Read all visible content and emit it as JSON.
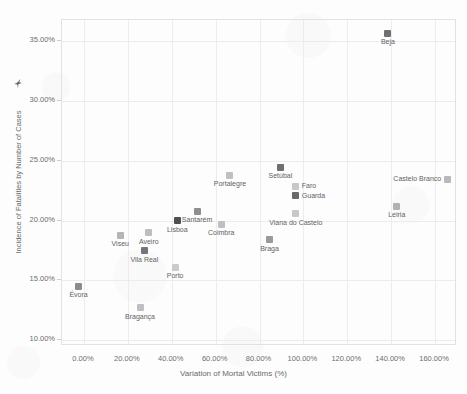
{
  "chart_data": {
    "type": "scatter",
    "title": "",
    "xlabel": "Variation of Mortal Victims (%)",
    "ylabel": "Incidence of Fatalities by Number of Cases",
    "xlim": [
      -10,
      170
    ],
    "ylim": [
      9.5,
      36.8
    ],
    "grid": true,
    "legend": "none",
    "xticks": [
      "0.00%",
      "20.00%",
      "40.00%",
      "60.00%",
      "80.00%",
      "100.00%",
      "120.00%",
      "140.00%",
      "160.00%"
    ],
    "xtick_values": [
      0,
      20,
      40,
      60,
      80,
      100,
      120,
      140,
      160
    ],
    "yticks": [
      "10.00%",
      "15.00%",
      "20.00%",
      "25.00%",
      "30.00%",
      "35.00%"
    ],
    "ytick_values": [
      10,
      15,
      20,
      25,
      30,
      35
    ],
    "marker": "square",
    "points": [
      {
        "label": "Beja",
        "x": 139.0,
        "y": 35.6,
        "color": "#6f6f6f",
        "label_pos": "below"
      },
      {
        "label": "Castelo Branco",
        "x": 166.0,
        "y": 23.4,
        "color": "#b9b9bd",
        "label_pos": "left"
      },
      {
        "label": "Portalegre",
        "x": 67.0,
        "y": 23.7,
        "color": "#c0c0c4",
        "label_pos": "below"
      },
      {
        "label": "Setúbal",
        "x": 90.0,
        "y": 24.4,
        "color": "#6f6f6f",
        "label_pos": "below"
      },
      {
        "label": "Faro",
        "x": 97.0,
        "y": 22.8,
        "color": "#c8c8cc",
        "label_pos": "right"
      },
      {
        "label": "Guarda",
        "x": 97.0,
        "y": 22.0,
        "color": "#6a6a6a",
        "label_pos": "right"
      },
      {
        "label": "Santarém",
        "x": 52.0,
        "y": 20.7,
        "color": "#8e8e92",
        "label_pos": "below"
      },
      {
        "label": "Viana do Castelo",
        "x": 97.0,
        "y": 20.5,
        "color": "#c8c8cc",
        "label_pos": "below"
      },
      {
        "label": "Leiria",
        "x": 143.0,
        "y": 21.1,
        "color": "#b2b2b6",
        "label_pos": "below"
      },
      {
        "label": "Lisboa",
        "x": 43.0,
        "y": 19.9,
        "color": "#4f4f4f",
        "label_pos": "below"
      },
      {
        "label": "Coimbra",
        "x": 63.0,
        "y": 19.6,
        "color": "#c0c0c4",
        "label_pos": "below"
      },
      {
        "label": "Braga",
        "x": 85.0,
        "y": 18.3,
        "color": "#9a9a9e",
        "label_pos": "below"
      },
      {
        "label": "Aveiro",
        "x": 30.0,
        "y": 18.9,
        "color": "#bdbdc1",
        "label_pos": "below"
      },
      {
        "label": "Viseu",
        "x": 17.0,
        "y": 18.7,
        "color": "#b5b5b9",
        "label_pos": "below"
      },
      {
        "label": "Vila Real",
        "x": 28.0,
        "y": 17.4,
        "color": "#757579",
        "label_pos": "below"
      },
      {
        "label": "Porto",
        "x": 42.0,
        "y": 16.0,
        "color": "#cacace",
        "label_pos": "below"
      },
      {
        "label": "Évora",
        "x": -2.0,
        "y": 14.4,
        "color": "#8c8c90",
        "label_pos": "below"
      },
      {
        "label": "Bragança",
        "x": 26.0,
        "y": 12.6,
        "color": "#bfbfc3",
        "label_pos": "below"
      }
    ]
  },
  "axes": {
    "x_title": "Variation of Mortal Victims (%)",
    "y_title": "Incidence of Fatalities by Number of Cases"
  },
  "icons": {
    "y_axis_pin": "pin-icon"
  },
  "colors": {
    "grid": "#ececee",
    "frame": "#e2e2e4",
    "text": "#6a6a6a",
    "background": "#fdfdfd"
  }
}
